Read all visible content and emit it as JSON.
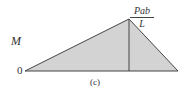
{
  "diagram": {
    "type": "bending-moment-diagram",
    "y_axis_label": "M",
    "origin_label": "0",
    "peak_label": {
      "numerator": "Pab",
      "denominator": "L"
    },
    "caption": "(c)",
    "colors": {
      "fill": "#d3d3d3",
      "stroke": "#444444"
    },
    "shape": {
      "start": [
        25,
        71
      ],
      "peak": [
        129,
        19
      ],
      "end": [
        178,
        71
      ],
      "peak_vertical_line": true
    }
  }
}
